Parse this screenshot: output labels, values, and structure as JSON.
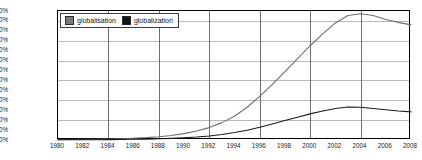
{
  "chart_data": {
    "type": "line",
    "title": "",
    "xlabel": "",
    "ylabel": "",
    "xlim": [
      1980,
      2008
    ],
    "ylim": [
      0.0,
      0.0013
    ],
    "grid": true,
    "legend_position": "top-left",
    "y_tick_labels": [
      "0.001300%",
      "0.001200%",
      "0.001100%",
      "0.001000%",
      "0.000900%",
      "0.000800%",
      "0.000700%",
      "0.000600%",
      "0.000500%",
      "0.000400%",
      "0.000300%",
      "0.000200%",
      "0.000100%",
      "0.000000%"
    ],
    "y_tick_values": [
      0.0013,
      0.0012,
      0.0011,
      0.001,
      0.0009,
      0.0008,
      0.0007,
      0.0006,
      0.0005,
      0.0004,
      0.0003,
      0.0002,
      0.0001,
      0.0
    ],
    "y_gridline_values": [
      0.0012,
      0.001,
      0.0008,
      0.0006,
      0.0004,
      0.0002
    ],
    "x_tick_labels": [
      "1980",
      "1982",
      "1984",
      "1986",
      "1988",
      "1990",
      "1992",
      "1994",
      "1996",
      "1998",
      "2000",
      "2002",
      "2004",
      "2006",
      "2008"
    ],
    "x_tick_values": [
      1980,
      1982,
      1984,
      1986,
      1988,
      1990,
      1992,
      1994,
      1996,
      1998,
      2000,
      2002,
      2004,
      2006,
      2008
    ],
    "x_gridline_values": [
      1984,
      1988,
      1992,
      1996,
      2000,
      2004,
      2008
    ],
    "x": [
      1980,
      1981,
      1982,
      1983,
      1984,
      1985,
      1986,
      1987,
      1988,
      1989,
      1990,
      1991,
      1992,
      1993,
      1994,
      1995,
      1996,
      1997,
      1998,
      1999,
      2000,
      2001,
      2002,
      2003,
      2004,
      2005,
      2006,
      2007,
      2008
    ],
    "series": [
      {
        "name": "globalisation",
        "color": "#6f6f6f",
        "values": [
          4e-06,
          5e-06,
          6e-06,
          8e-06,
          1e-05,
          1.3e-05,
          1.8e-05,
          2.4e-05,
          3.3e-05,
          4.6e-05,
          6.4e-05,
          9e-05,
          0.000125,
          0.000175,
          0.00024,
          0.00033,
          0.00044,
          0.00056,
          0.00069,
          0.00082,
          0.00095,
          0.00107,
          0.00118,
          0.001255,
          0.001272,
          0.001255,
          0.001215,
          0.001185,
          0.00116
        ]
      },
      {
        "name": "globalization",
        "color": "#1a1a1a",
        "values": [
          2e-06,
          2e-06,
          3e-06,
          3e-06,
          4e-06,
          5e-06,
          7e-06,
          9e-06,
          1.2e-05,
          1.6e-05,
          2.2e-05,
          3e-05,
          4.1e-05,
          5.6e-05,
          7.5e-05,
          9.9e-05,
          0.000128,
          0.000161,
          0.000196,
          0.00023,
          0.000263,
          0.000293,
          0.000318,
          0.000332,
          0.00033,
          0.000318,
          0.000305,
          0.000292,
          0.000283
        ]
      }
    ]
  },
  "legend": {
    "items": [
      {
        "label": "globalisation",
        "swatch": "globalisation-swatch"
      },
      {
        "label": "globalization",
        "swatch": "globalization-swatch"
      }
    ]
  }
}
